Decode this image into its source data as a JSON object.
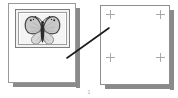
{
  "figure": {
    "caption": "1",
    "background_color": "#ffffff"
  },
  "source_panel": {
    "name": "source-photo-page",
    "sheet_color": "#ffffff",
    "border_color": "#9a9a9a",
    "shadow_color": "#8a8a8a",
    "photo": {
      "subject": "butterfly",
      "frame_border_color": "#7d7d7d",
      "mat_color": "#ffffff",
      "background_color": "#f2f2f2",
      "wing_fill_color": "#c8c8c8",
      "wing_outline_color": "#4a4a4a",
      "body_color": "#2e2e2e",
      "antenna_color": "#2e2e2e",
      "lower_wing_fill_color": "#d6d6d6"
    }
  },
  "target_panel": {
    "name": "blank-target-page",
    "sheet_color": "#ffffff",
    "border_color": "#8f8f8f",
    "shadow_color": "#8a8a8a",
    "crop_mark_color": "#a9a9a9",
    "crop_marks": [
      {
        "id": "top-left",
        "label": "+"
      },
      {
        "id": "top-right",
        "label": "+"
      },
      {
        "id": "bottom-left",
        "label": "+"
      },
      {
        "id": "bottom-right",
        "label": "+"
      }
    ]
  },
  "connector": {
    "name": "pointer-line",
    "color": "#1a1a1a",
    "x1": 67,
    "y1": 58,
    "x2": 109,
    "y2": 28
  }
}
